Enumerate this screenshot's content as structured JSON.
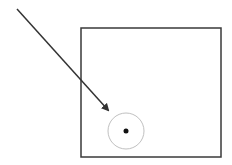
{
  "canvas": {
    "width": 232,
    "height": 165,
    "background": "#ffffff"
  },
  "colors": {
    "box_stroke": "#3a3a3a",
    "arrow_stroke": "#333333",
    "circle_stroke": "#b0b0b0",
    "dot_fill": "#111111"
  },
  "box": {
    "x": 81,
    "y": 28,
    "width": 140,
    "height": 129
  },
  "arrow": {
    "x1": 17,
    "y1": 9,
    "x2": 108,
    "y2": 110
  },
  "target_circle": {
    "cx": 126,
    "cy": 131,
    "r": 18
  },
  "target_dot": {
    "cx": 126,
    "cy": 131,
    "r": 2.5
  }
}
